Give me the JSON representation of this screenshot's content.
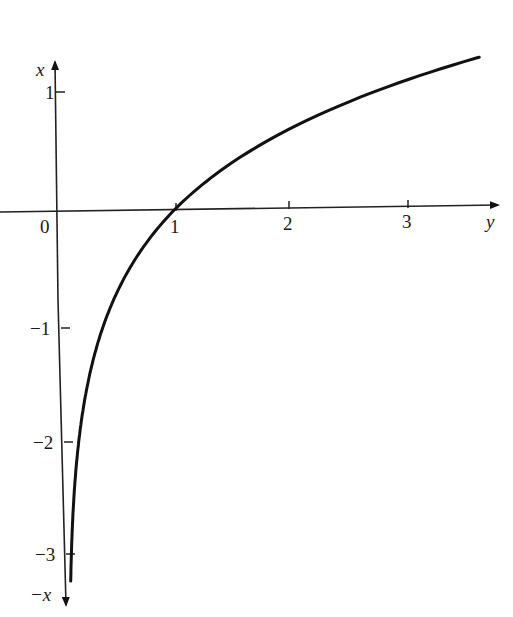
{
  "chart_data": {
    "type": "line",
    "title": "",
    "xlabel": "y",
    "ylabel": "x",
    "ylabel_negative": "-x",
    "function": "x = ln y",
    "xlim": [
      0,
      3.7
    ],
    "ylim": [
      -3.3,
      1.4
    ],
    "x_ticks": [
      1,
      2,
      3
    ],
    "x_tick_labels": [
      "1",
      "2",
      "3"
    ],
    "y_ticks": [
      1,
      -1,
      -2,
      -3
    ],
    "y_tick_labels": [
      "1",
      "−1",
      "−2",
      "−3"
    ],
    "origin_label": "0",
    "grid": false,
    "legend": null,
    "series": [
      {
        "name": "x = ln y",
        "x": [
          0.04,
          0.05,
          0.07,
          0.1,
          0.135,
          0.2,
          0.3,
          0.368,
          0.5,
          0.7,
          1.0,
          1.3,
          1.6,
          2.0,
          2.5,
          3.0,
          3.6
        ],
        "y": [
          -3.22,
          -3.0,
          -2.66,
          -2.3,
          -2.0,
          -1.61,
          -1.2,
          -1.0,
          -0.69,
          -0.36,
          0.0,
          0.26,
          0.47,
          0.69,
          0.92,
          1.1,
          1.28
        ]
      }
    ]
  },
  "labels": {
    "x_axis_name": "y",
    "y_axis_pos_name": "x",
    "y_axis_neg_name": "−x",
    "origin": "0",
    "tick_h_1": "1",
    "tick_h_2": "2",
    "tick_h_3": "3",
    "tick_v_1": "1",
    "tick_v_m1": "−1",
    "tick_v_m2": "−2",
    "tick_v_m3": "−3"
  }
}
